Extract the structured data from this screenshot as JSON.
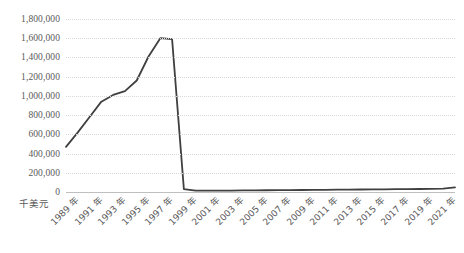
{
  "chart_data": {
    "type": "line",
    "title": "",
    "xlabel": "",
    "ylabel": "千美元",
    "ylim": [
      0,
      1800000
    ],
    "ytick_labels": [
      "1,800,000",
      "1,600,000",
      "1,400,000",
      "1,200,000",
      "1,000,000",
      "800,000",
      "600,000",
      "400,000",
      "200,000",
      "0"
    ],
    "ytick_values": [
      1800000,
      1600000,
      1400000,
      1200000,
      1000000,
      800000,
      600000,
      400000,
      200000,
      0
    ],
    "grid": true,
    "legend": false,
    "line_color": "#404040",
    "grid_color": "#d9d9d9",
    "axis_color": "#bfbfbf",
    "text_color": "#595959",
    "xtick_labels": [
      "1989 年",
      "1991 年",
      "1993 年",
      "1995 年",
      "1997 年",
      "1999 年",
      "2001 年",
      "2003 年",
      "2005 年",
      "2007 年",
      "2009 年",
      "2011 年",
      "2013 年",
      "2015 年",
      "2017 年",
      "2019 年",
      "2021 年"
    ],
    "x": [
      1989,
      1990,
      1991,
      1992,
      1993,
      1994,
      1995,
      1996,
      1997,
      1998,
      1999,
      2000,
      2001,
      2002,
      2003,
      2004,
      2005,
      2006,
      2007,
      2008,
      2009,
      2010,
      2011,
      2012,
      2013,
      2014,
      2015,
      2016,
      2017,
      2018,
      2019,
      2020,
      2021,
      2022
    ],
    "values": [
      470000,
      620000,
      780000,
      940000,
      1010000,
      1050000,
      1160000,
      1410000,
      1600000,
      1590000,
      30000,
      15000,
      14000,
      14000,
      15000,
      16000,
      17000,
      18000,
      19000,
      20000,
      21000,
      22000,
      23000,
      24000,
      25000,
      26000,
      27000,
      28000,
      29000,
      30000,
      31000,
      33000,
      36000,
      48000
    ],
    "series": [
      {
        "name": "千美元",
        "values": [
          470000,
          620000,
          780000,
          940000,
          1010000,
          1050000,
          1160000,
          1410000,
          1600000,
          1590000,
          30000,
          15000,
          14000,
          14000,
          15000,
          16000,
          17000,
          18000,
          19000,
          20000,
          21000,
          22000,
          23000,
          24000,
          25000,
          26000,
          27000,
          28000,
          29000,
          30000,
          31000,
          33000,
          36000,
          48000
        ]
      }
    ],
    "annotations": {
      "peak_year": 1997,
      "peak_value": 1600000,
      "start_year": 1989,
      "end_year": 2022
    }
  }
}
